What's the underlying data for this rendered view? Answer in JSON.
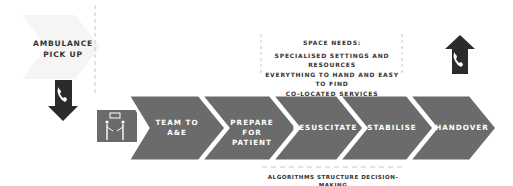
{
  "colors": {
    "chevron": "#6b6b6b",
    "chevron_border": "#ffffff",
    "icon_dark": "#2b2b2b",
    "ghost_arrow": "#f4f4f4",
    "dashes": "#bdbdbd",
    "text_dark": "#333333"
  },
  "start": {
    "label_line1": "AMBULANCE",
    "label_line2": "PICK UP",
    "icon": "phone-down-arrow-icon"
  },
  "team_icon": "team-talking-icon",
  "steps": [
    {
      "line1": "TEAM TO",
      "line2": "A&E"
    },
    {
      "line1": "PREPARE",
      "line2": "FOR PATIENT"
    },
    {
      "line1": "RESUSCITATE",
      "line2": ""
    },
    {
      "line1": "STABILISE",
      "line2": ""
    },
    {
      "line1": "HANDOVER",
      "line2": ""
    }
  ],
  "end": {
    "icon": "phone-up-arrow-icon"
  },
  "space_needs": {
    "title": "SPACE NEEDS:",
    "lines": [
      "SPECIALISED SETTINGS AND RESOURCES",
      "EVERYTHING TO HAND AND EASY TO FIND",
      "CO-LOCATED SERVICES"
    ]
  },
  "algorithms": {
    "caption": "ALGORITHMS STRUCTURE DECISION-MAKING"
  }
}
